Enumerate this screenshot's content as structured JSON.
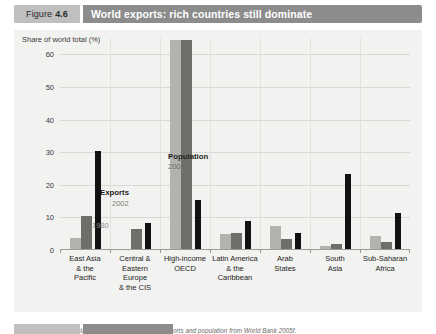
{
  "figure": {
    "number_word": "Figure",
    "number": "4.6",
    "title": "World exports: rich countries still dominate"
  },
  "source": {
    "label": "Source:",
    "text": " Calculated on the basis of data on exports and population from World Bank 2005f."
  },
  "legend": {
    "exports_title": "Exports",
    "exports_year_2002": "2002",
    "exports_year_1980": "1980",
    "population_title": "Population",
    "population_year": "2002"
  },
  "colors": {
    "bar_1980": "#b2b2ae",
    "bar_2002": "#6e6e6b",
    "bar_population": "#111111",
    "panel_background": "#f2f2f0",
    "title_bar": "#8c8c8c",
    "figure_tag": "#bfbfbf"
  },
  "chart_data": {
    "type": "bar",
    "title": "World exports: rich countries still dominate",
    "subtitle": "",
    "xlabel": "",
    "ylabel": "Share of world total (%)",
    "ylim": [
      0,
      65
    ],
    "yticks": [
      0,
      10,
      20,
      30,
      40,
      50,
      60
    ],
    "ytick_labels": [
      "0",
      "10",
      "20",
      "30",
      "40",
      "50",
      "60"
    ],
    "grid": true,
    "legend_position": "inside-plot",
    "categories": [
      "East Asia\n& the\nPacific",
      "Central &\nEastern Europe\n& the CIS",
      "High-income\nOECD",
      "Latin America\n& the\nCaribbean",
      "Arab\nStates",
      "South\nAsia",
      "Sub-Saharan\nAfrica"
    ],
    "category_lines": [
      [
        "East Asia",
        "& the",
        "Pacific"
      ],
      [
        "Central &",
        "Eastern Europe",
        "& the CIS"
      ],
      [
        "High-income",
        "OECD"
      ],
      [
        "Latin America",
        "& the",
        "Caribbean"
      ],
      [
        "Arab",
        "States"
      ],
      [
        "South",
        "Asia"
      ],
      [
        "Sub-Saharan",
        "Africa"
      ]
    ],
    "series": [
      {
        "name": "Exports 1980",
        "color": "#b2b2ae",
        "values": [
          3.5,
          0.0,
          64.0,
          4.5,
          7.0,
          0.8,
          4.0
        ]
      },
      {
        "name": "Exports 2002",
        "color": "#6e6e6b",
        "values": [
          10.0,
          6.0,
          64.0,
          5.0,
          3.0,
          1.5,
          2.0
        ]
      },
      {
        "name": "Population 2002",
        "color": "#111111",
        "values": [
          30.0,
          8.0,
          15.0,
          8.5,
          5.0,
          23.0,
          11.0
        ]
      }
    ]
  }
}
